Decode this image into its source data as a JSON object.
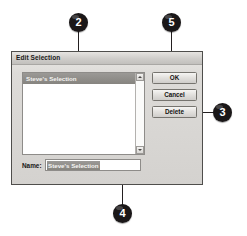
{
  "figure": {
    "callouts": [
      {
        "number": "2",
        "target": "list-item"
      },
      {
        "number": "5",
        "target": "ok-button"
      },
      {
        "number": "3",
        "target": "delete-button"
      },
      {
        "number": "4",
        "target": "name-input"
      }
    ]
  },
  "dialog": {
    "title": "Edit Selection",
    "list": {
      "items": [
        {
          "label": "Steve's Selection",
          "selected": true
        }
      ],
      "scrollbar": {
        "up_icon": "scroll-up-arrow-icon",
        "down_icon": "scroll-down-arrow-icon"
      }
    },
    "buttons": {
      "ok": "OK",
      "cancel": "Cancel",
      "delete": "Delete"
    },
    "name_field": {
      "label": "Name:",
      "value": "Steve's Selection",
      "placeholder": ""
    }
  },
  "colors": {
    "badge_fill": "#1a1718",
    "badge_text": "#ffffff",
    "leader_line": "#231f20",
    "dialog_face": "#d8d8d6",
    "dialog_border": "#4f4e4c",
    "selection_fill": "#8e8c88",
    "selection_text": "#f4f3f1",
    "field_background": "#ffffff"
  }
}
